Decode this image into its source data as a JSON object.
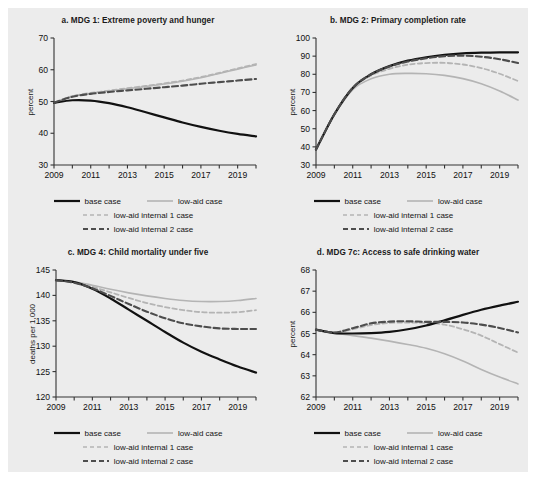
{
  "figure": {
    "background_color": "#ececec",
    "panel_count": 4
  },
  "series_style": {
    "base_case_color": "#111111",
    "low_aid_color": "#b4b4b4",
    "low_aid_internal_1_color": "#b4b4b4",
    "low_aid_internal_2_color": "#4d4d4d"
  },
  "legend": {
    "items": [
      {
        "label": "base case",
        "style": "solid",
        "color": "#111111"
      },
      {
        "label": "low-aid case",
        "style": "solid",
        "color": "#b4b4b4"
      },
      {
        "label": "low-aid internal 1 case",
        "style": "dashed",
        "color": "#b4b4b4"
      },
      {
        "label": "low-aid internal 2 case",
        "style": "dashed",
        "color": "#4d4d4d"
      }
    ]
  },
  "chart_data": [
    {
      "type": "line",
      "panel": "a",
      "title": "a.  MDG 1: Extreme poverty and hunger",
      "xlabel": "",
      "ylabel": "percent",
      "xlim": [
        2009,
        2020
      ],
      "ylim": [
        30,
        70
      ],
      "yticks": [
        30,
        40,
        50,
        60,
        70
      ],
      "xticks": [
        2009,
        2010,
        2011,
        2012,
        2013,
        2014,
        2015,
        2016,
        2017,
        2018,
        2019,
        2020
      ],
      "xticklabels": [
        "2009",
        "",
        "2011",
        "",
        "2013",
        "",
        "2015",
        "",
        "2017",
        "",
        "2019",
        ""
      ],
      "grid": false,
      "legend_position": "below",
      "x": [
        2009,
        2010,
        2011,
        2012,
        2013,
        2014,
        2015,
        2016,
        2017,
        2018,
        2019,
        2020
      ],
      "series": [
        {
          "name": "base case",
          "values": [
            49.6,
            50.4,
            50.3,
            49.5,
            48.2,
            46.6,
            45.0,
            43.4,
            42.0,
            40.8,
            39.8,
            39.0
          ]
        },
        {
          "name": "low-aid case",
          "values": [
            49.6,
            51.6,
            52.6,
            53.3,
            54.0,
            54.7,
            55.5,
            56.4,
            57.5,
            58.8,
            60.2,
            61.5
          ]
        },
        {
          "name": "low-aid internal 1 case",
          "values": [
            49.6,
            51.7,
            52.7,
            53.4,
            54.2,
            54.9,
            55.7,
            56.6,
            57.7,
            59.0,
            60.4,
            61.8
          ]
        },
        {
          "name": "low-aid internal 2 case",
          "values": [
            49.6,
            51.5,
            52.4,
            53.0,
            53.5,
            54.0,
            54.5,
            55.0,
            55.6,
            56.1,
            56.6,
            57.1
          ]
        }
      ]
    },
    {
      "type": "line",
      "panel": "b",
      "title": "b.  MDG 2: Primary completion rate",
      "xlabel": "",
      "ylabel": "percent",
      "xlim": [
        2009,
        2020
      ],
      "ylim": [
        30,
        100
      ],
      "yticks": [
        30,
        40,
        50,
        60,
        70,
        80,
        90,
        100
      ],
      "xticks": [
        2009,
        2010,
        2011,
        2012,
        2013,
        2014,
        2015,
        2016,
        2017,
        2018,
        2019,
        2020
      ],
      "xticklabels": [
        "2009",
        "",
        "2011",
        "",
        "2013",
        "",
        "2015",
        "",
        "2017",
        "",
        "2019",
        ""
      ],
      "grid": false,
      "legend_position": "below",
      "x": [
        2009,
        2010,
        2011,
        2012,
        2013,
        2014,
        2015,
        2016,
        2017,
        2018,
        2019,
        2020
      ],
      "series": [
        {
          "name": "base case",
          "values": [
            38.5,
            58.0,
            72.5,
            80.0,
            84.5,
            87.5,
            89.4,
            90.7,
            91.5,
            91.9,
            92.1,
            92.1
          ]
        },
        {
          "name": "low-aid case",
          "values": [
            38.5,
            57.5,
            71.5,
            77.5,
            80.0,
            80.5,
            80.3,
            79.4,
            77.6,
            74.8,
            70.8,
            65.8
          ]
        },
        {
          "name": "low-aid internal 1 case",
          "values": [
            38.5,
            58.0,
            72.3,
            79.3,
            83.0,
            85.3,
            86.2,
            86.3,
            85.4,
            83.4,
            80.3,
            76.3
          ]
        },
        {
          "name": "low-aid internal 2 case",
          "values": [
            38.5,
            58.0,
            72.5,
            80.0,
            84.3,
            87.0,
            88.8,
            90.0,
            90.3,
            89.7,
            88.3,
            86.2
          ]
        }
      ]
    },
    {
      "type": "line",
      "panel": "c",
      "title": "c.  MDG 4: Child mortality under five",
      "xlabel": "",
      "ylabel": "deaths per 1,000",
      "xlim": [
        2009,
        2020
      ],
      "ylim": [
        120,
        145
      ],
      "yticks": [
        120,
        125,
        130,
        135,
        140,
        145
      ],
      "xticks": [
        2009,
        2010,
        2011,
        2012,
        2013,
        2014,
        2015,
        2016,
        2017,
        2018,
        2019,
        2020
      ],
      "xticklabels": [
        "2009",
        "",
        "2011",
        "",
        "2013",
        "",
        "2015",
        "",
        "2017",
        "",
        "2019",
        ""
      ],
      "grid": false,
      "legend_position": "below",
      "x": [
        2009,
        2010,
        2011,
        2012,
        2013,
        2014,
        2015,
        2016,
        2017,
        2018,
        2019,
        2020
      ],
      "series": [
        {
          "name": "base case",
          "values": [
            143.0,
            142.6,
            141.3,
            139.4,
            137.2,
            135.0,
            132.8,
            130.7,
            128.9,
            127.4,
            126.0,
            124.8
          ]
        },
        {
          "name": "low-aid case",
          "values": [
            143.0,
            142.7,
            142.0,
            141.2,
            140.5,
            139.9,
            139.4,
            139.0,
            138.8,
            138.8,
            139.0,
            139.4
          ]
        },
        {
          "name": "low-aid internal 1 case",
          "values": [
            143.0,
            142.6,
            141.7,
            140.6,
            139.5,
            138.5,
            137.7,
            137.1,
            136.7,
            136.6,
            136.7,
            137.1
          ]
        },
        {
          "name": "low-aid internal 2 case",
          "values": [
            143.0,
            142.5,
            141.4,
            139.9,
            138.3,
            136.8,
            135.5,
            134.5,
            133.9,
            133.5,
            133.4,
            133.4
          ]
        }
      ]
    },
    {
      "type": "line",
      "panel": "d",
      "title": "d.  MDG 7c: Access to safe drinking water",
      "xlabel": "",
      "ylabel": "percent",
      "xlim": [
        2009,
        2020
      ],
      "ylim": [
        62,
        68
      ],
      "yticks": [
        62,
        63,
        64,
        65,
        66,
        67,
        68
      ],
      "xticks": [
        2009,
        2010,
        2011,
        2012,
        2013,
        2014,
        2015,
        2016,
        2017,
        2018,
        2019,
        2020
      ],
      "xticklabels": [
        "2009",
        "",
        "2011",
        "",
        "2013",
        "",
        "2015",
        "",
        "2017",
        "",
        "2019",
        ""
      ],
      "grid": false,
      "legend_position": "below",
      "x": [
        2009,
        2010,
        2011,
        2012,
        2013,
        2014,
        2015,
        2016,
        2017,
        2018,
        2019,
        2020
      ],
      "series": [
        {
          "name": "base case",
          "values": [
            65.18,
            65.02,
            65.0,
            65.02,
            65.08,
            65.2,
            65.38,
            65.62,
            65.88,
            66.12,
            66.32,
            66.5
          ]
        },
        {
          "name": "low-aid case",
          "values": [
            65.18,
            65.02,
            64.9,
            64.78,
            64.64,
            64.48,
            64.3,
            64.04,
            63.7,
            63.3,
            62.94,
            62.62
          ]
        },
        {
          "name": "low-aid internal 1 case",
          "values": [
            65.18,
            65.05,
            65.2,
            65.4,
            65.5,
            65.52,
            65.5,
            65.42,
            65.2,
            64.9,
            64.5,
            64.1
          ]
        },
        {
          "name": "low-aid internal 2 case",
          "values": [
            65.18,
            65.05,
            65.25,
            65.48,
            65.56,
            65.58,
            65.55,
            65.55,
            65.52,
            65.42,
            65.26,
            65.05
          ]
        }
      ]
    }
  ]
}
